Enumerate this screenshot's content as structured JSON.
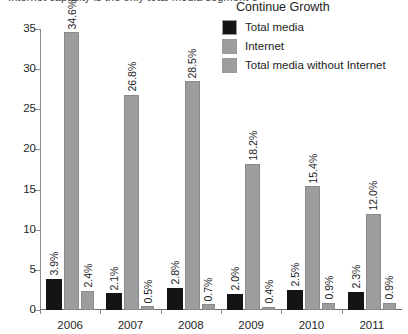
{
  "clipped_title": "Internet capacity is the only total media segment expected to continue growth",
  "legend": {
    "title": "Continue Growth",
    "items": [
      {
        "label": "Total media",
        "color": "#141414",
        "swatch": "legend-swatch-total-media"
      },
      {
        "label": "Internet",
        "color": "#9d9d9d",
        "swatch": "legend-swatch-internet"
      },
      {
        "label": "Total media without Internet",
        "color": "#9d9d9d",
        "swatch": "legend-swatch-total-media-without-internet"
      }
    ]
  },
  "axis": {
    "y_ticks": [
      "0",
      "5",
      "10",
      "15",
      "20",
      "25",
      "30",
      "35"
    ],
    "x_ticks": [
      "2006",
      "2007",
      "2008",
      "2009",
      "2010",
      "2011"
    ]
  },
  "chart_data": {
    "type": "bar",
    "title": "Internet capacity is the only total media segment expected to continue growth",
    "xlabel": "",
    "ylabel": "",
    "ylim": [
      0,
      35
    ],
    "ytick_step": 5,
    "grid": false,
    "legend_position": "top-right",
    "legend_title": "Continue Growth",
    "value_label_suffix": "%",
    "value_label_rotation": -90,
    "categories": [
      "2006",
      "2007",
      "2008",
      "2009",
      "2010",
      "2011"
    ],
    "series": [
      {
        "name": "Total media",
        "color": "#141414",
        "values": [
          3.9,
          2.1,
          2.8,
          2.0,
          2.5,
          2.3
        ],
        "labels": [
          "3.9%",
          "2.1%",
          "2.8%",
          "2.0%",
          "2.5%",
          "2.3%"
        ]
      },
      {
        "name": "Internet",
        "color": "#9d9d9d",
        "values": [
          34.6,
          26.8,
          28.5,
          18.2,
          15.4,
          12.0
        ],
        "labels": [
          "34.6%",
          "26.8%",
          "28.5%",
          "18.2%",
          "15.4%",
          "12.0%"
        ]
      },
      {
        "name": "Total media without Internet",
        "color": "#9d9d9d",
        "values": [
          2.4,
          0.5,
          0.7,
          0.4,
          0.9,
          0.9
        ],
        "labels": [
          "2.4%",
          "0.5%",
          "0.7%",
          "0.4%",
          "0.9%",
          "0.9%"
        ]
      }
    ]
  }
}
